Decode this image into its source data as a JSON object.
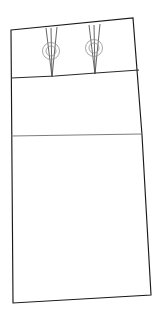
{
  "drawing": {
    "title": "Skirt Pattern Technical Drawing",
    "type": "garment-pattern-line-drawing",
    "canvas": {
      "width": 167,
      "height": 311,
      "background": "#ffffff"
    },
    "colors": {
      "outline": "#1a1a1a",
      "seam": "#2b2b2b",
      "hipline": "#6e6e6e",
      "dart": "#4a4a4a",
      "dart_circle": "#8a8a8a",
      "fill": "#ffffff"
    },
    "shapes": {
      "body_outline": {
        "name": "skirt-outline",
        "points": "11,30 133,18 142,135 151,295 13,303 11,30"
      },
      "yoke_seam": {
        "name": "yoke-waistline-seam",
        "points": "11,78 55,76 96,73 139,70"
      },
      "hip_line": {
        "name": "hip-line",
        "points": "11,136 142,134"
      },
      "dart_left": {
        "name": "dart-left",
        "legs": "46,28 52,77 57,27",
        "center_line": "51,28 52,77"
      },
      "dart_right": {
        "name": "dart-right",
        "legs": "89,25 95,74 100,24",
        "center_line": "94,25 95,74"
      },
      "dart_point_circle_left": {
        "name": "dart-point-circle-left",
        "cx": 51,
        "cy": 51,
        "r_outer": 8.5,
        "r_inner": 5.0
      },
      "dart_point_circle_right": {
        "name": "dart-point-circle-right",
        "cx": 94,
        "cy": 48,
        "r_outer": 8.5,
        "r_inner": 5.0
      },
      "yoke_divider": {
        "name": "yoke-center-divider",
        "points": "52,28 52,77"
      }
    },
    "labels": {
      "piece_name": "",
      "notes": ""
    }
  }
}
